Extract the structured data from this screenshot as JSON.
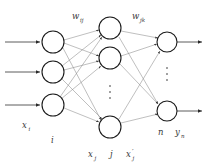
{
  "figure": {
    "type": "neural-network-diagram",
    "background_color": "#ffffff",
    "node_stroke_color": "#1a1a1a",
    "edge_color": "#8a8a8a",
    "io_arrow_color": "#4a4a4a",
    "text_color": "#3a3a3a"
  },
  "labels": {
    "weight_input_hidden": "w",
    "weight_input_hidden_sub": "ij",
    "weight_hidden_output": "w",
    "weight_hidden_output_sub": "jk",
    "input_signal": "x",
    "input_signal_sub": "i",
    "input_layer_index": "i",
    "hidden_input_signal": "x",
    "hidden_input_signal_sub": "j",
    "hidden_layer_index": "j",
    "hidden_output_signal": "x",
    "hidden_output_signal_prime": "′",
    "hidden_output_signal_sub": "j",
    "output_layer_index": "n",
    "output_signal": "y",
    "output_signal_sub": "n",
    "vertical_ellipsis": "⋮"
  },
  "layers": [
    {
      "name": "input-layer",
      "index_label": "i",
      "visible_nodes": 3,
      "node_centers": [
        [
          53,
          42
        ],
        [
          53,
          72
        ],
        [
          53,
          105
        ]
      ],
      "radius": 11,
      "has_ellipsis": false
    },
    {
      "name": "hidden-layer",
      "index_label": "j",
      "visible_nodes": 3,
      "node_centers": [
        [
          110,
          28
        ],
        [
          110,
          58
        ],
        [
          110,
          127
        ]
      ],
      "radius": 11,
      "has_ellipsis": true,
      "ellipsis_position": [
        110,
        92
      ]
    },
    {
      "name": "output-layer",
      "index_label": "n",
      "visible_nodes": 2,
      "node_centers": [
        [
          167,
          42
        ],
        [
          167,
          111
        ]
      ],
      "radius": 10,
      "has_ellipsis": true,
      "ellipsis_position": [
        167,
        74
      ]
    }
  ]
}
